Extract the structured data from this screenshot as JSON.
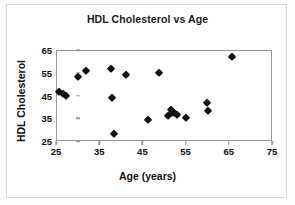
{
  "chart_data": {
    "type": "scatter",
    "title": "HDL Cholesterol vs Age",
    "xlabel": "Age (years)",
    "ylabel": "HDL Cholesterol",
    "xlim": [
      25,
      75
    ],
    "ylim": [
      25,
      65
    ],
    "xticks": [
      25,
      35,
      45,
      55,
      65,
      75
    ],
    "yticks": [
      25,
      35,
      45,
      55,
      65
    ],
    "grid": false,
    "legend": null,
    "marker": "diamond",
    "marker_color": "#111111",
    "frame_color": "#9a9a9a",
    "points": [
      {
        "x": 25.8,
        "y": 46.5
      },
      {
        "x": 26.6,
        "y": 45.8
      },
      {
        "x": 27.2,
        "y": 45.0
      },
      {
        "x": 30.2,
        "y": 53.2
      },
      {
        "x": 32.0,
        "y": 55.6
      },
      {
        "x": 37.8,
        "y": 56.6
      },
      {
        "x": 37.9,
        "y": 44.0
      },
      {
        "x": 38.4,
        "y": 28.2
      },
      {
        "x": 41.3,
        "y": 54.2
      },
      {
        "x": 46.2,
        "y": 34.2
      },
      {
        "x": 48.8,
        "y": 55.0
      },
      {
        "x": 51.0,
        "y": 36.0
      },
      {
        "x": 51.6,
        "y": 38.5
      },
      {
        "x": 51.8,
        "y": 37.2
      },
      {
        "x": 52.4,
        "y": 37.5
      },
      {
        "x": 53.1,
        "y": 36.6
      },
      {
        "x": 55.0,
        "y": 35.0
      },
      {
        "x": 60.0,
        "y": 41.8
      },
      {
        "x": 60.2,
        "y": 38.0
      },
      {
        "x": 65.7,
        "y": 62.0
      }
    ]
  }
}
